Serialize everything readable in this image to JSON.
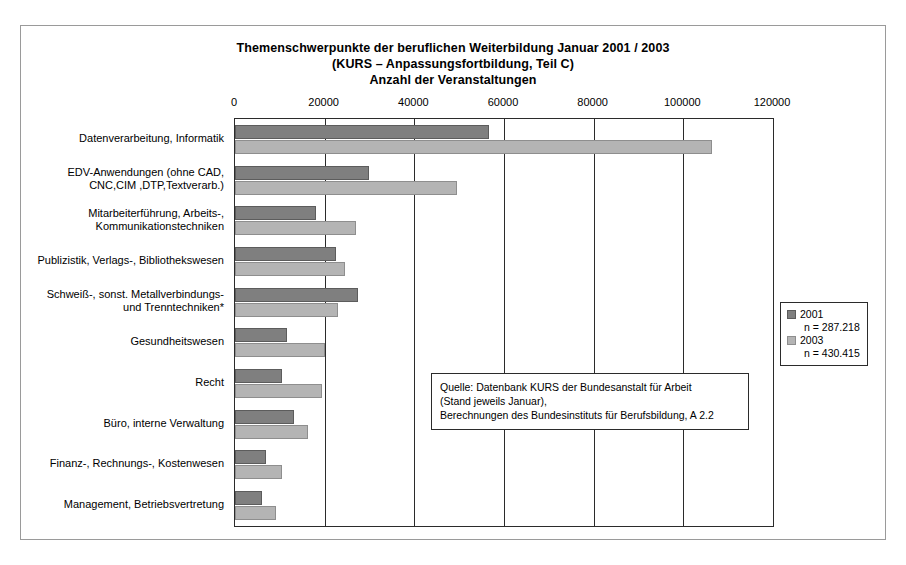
{
  "title": {
    "line1": "Themenschwerpunkte der beruflichen Weiterbildung Januar 2001 / 2003",
    "line2": "(KURS – Anpassungsfortbildung, Teil C)",
    "line3": "Anzahl der Veranstaltungen"
  },
  "legend": {
    "entries": [
      {
        "label": "2001",
        "n": "n = 287.218",
        "color": "#7f7f7f"
      },
      {
        "label": "2003",
        "n": "n = 430.415",
        "color": "#b4b4b4"
      }
    ]
  },
  "source_note": {
    "line1": "Quelle: Datenbank KURS der Bundesanstalt für Arbeit",
    "line2": "(Stand jeweils Januar),",
    "line3": "Berechnungen des Bundesinstituts für Berufsbildung, A 2.2"
  },
  "chart_data": {
    "type": "bar",
    "orientation": "horizontal",
    "title": "Themenschwerpunkte der beruflichen Weiterbildung Januar 2001 / 2003 (KURS – Anpassungsfortbildung, Teil C) Anzahl der Veranstaltungen",
    "xlabel": "",
    "ylabel": "",
    "xlim": [
      0,
      120000
    ],
    "xticks": [
      0,
      20000,
      40000,
      60000,
      80000,
      100000,
      120000
    ],
    "xtick_labels": [
      "0",
      "20000",
      "40000",
      "60000",
      "80000",
      "100000",
      "120000"
    ],
    "grid": true,
    "legend_position": "right",
    "categories": [
      "Datenverarbeitung, Informatik",
      "EDV-Anwendungen (ohne CAD,\nCNC,CIM ,DTP,Textverarb.)",
      "Mitarbeiterführung, Arbeits-,\nKommunikationstechniken",
      "Publizistik, Verlags-, Bibliothekswesen",
      "Schweiß-, sonst. Metallverbindungs-\nund Trenntechniken*",
      "Gesundheitswesen",
      "Recht",
      "Büro, interne Verwaltung",
      "Finanz-, Rechnungs-, Kostenwesen",
      "Management, Betriebsvertretung"
    ],
    "series": [
      {
        "name": "2001",
        "color": "#7f7f7f",
        "values": [
          56700,
          29900,
          18000,
          22500,
          27500,
          11500,
          10500,
          13200,
          7000,
          6000
        ]
      },
      {
        "name": "2003",
        "color": "#b4b4b4",
        "values": [
          106500,
          49500,
          27000,
          24500,
          23000,
          20000,
          19500,
          16200,
          10500,
          9200
        ]
      }
    ]
  }
}
